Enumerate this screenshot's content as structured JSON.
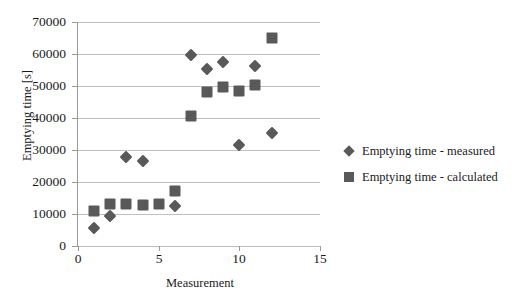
{
  "chart_data": {
    "type": "scatter",
    "title": "",
    "xlabel": "Measurement",
    "ylabel": "Emptying time  [s]",
    "xlim": [
      0,
      15
    ],
    "ylim": [
      0,
      70000
    ],
    "x_ticks": [
      "0",
      "5",
      "10",
      "15"
    ],
    "y_ticks": [
      "0",
      "10000",
      "20000",
      "30000",
      "40000",
      "50000",
      "60000",
      "70000"
    ],
    "grid": "horizontal",
    "legend_position": "right",
    "marker_color": "#595959",
    "gridline_color": "#bfbfbf",
    "axis_color": "#9a9a9a",
    "series": [
      {
        "name": "Emptying time - measured",
        "marker": "diamond",
        "points": [
          {
            "x": 1,
            "y": 5500
          },
          {
            "x": 2,
            "y": 9500
          },
          {
            "x": 3,
            "y": 27700
          },
          {
            "x": 4,
            "y": 26700
          },
          {
            "x": 6,
            "y": 12400
          },
          {
            "x": 7,
            "y": 59600
          },
          {
            "x": 8,
            "y": 55200
          },
          {
            "x": 9,
            "y": 57500
          },
          {
            "x": 10,
            "y": 31500
          },
          {
            "x": 11,
            "y": 56400
          },
          {
            "x": 12,
            "y": 35400
          }
        ]
      },
      {
        "name": "Emptying time - calculated",
        "marker": "square",
        "points": [
          {
            "x": 1,
            "y": 11000
          },
          {
            "x": 2,
            "y": 13000
          },
          {
            "x": 3,
            "y": 13200
          },
          {
            "x": 4,
            "y": 12800
          },
          {
            "x": 5,
            "y": 13200
          },
          {
            "x": 6,
            "y": 17100
          },
          {
            "x": 7,
            "y": 40700
          },
          {
            "x": 8,
            "y": 48200
          },
          {
            "x": 9,
            "y": 49700
          },
          {
            "x": 10,
            "y": 48400
          },
          {
            "x": 11,
            "y": 50200
          },
          {
            "x": 12,
            "y": 65000
          }
        ]
      }
    ]
  },
  "legend": {
    "items": [
      {
        "label": "Emptying time - measured",
        "marker": "diamond"
      },
      {
        "label": "Emptying time - calculated",
        "marker": "square"
      }
    ]
  }
}
